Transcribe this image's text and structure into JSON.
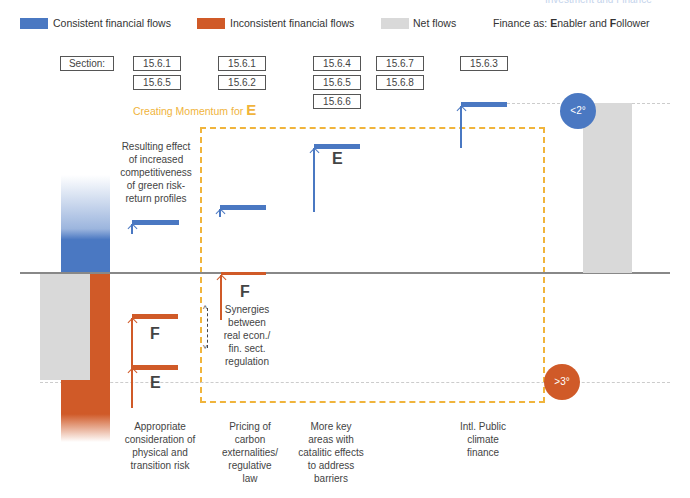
{
  "header": {
    "top_right_text": "Investment and Finance"
  },
  "legend": {
    "items": [
      {
        "label": "Consistent financial flows",
        "color": "#4a78c2"
      },
      {
        "label": "Inconsistent financial flows",
        "color": "#d05a28"
      },
      {
        "label": "Net flows",
        "color": "#d9d9d9"
      }
    ],
    "finance_as_prefix": "Finance as: ",
    "enabler": "Enabler",
    "and": " and ",
    "follower": "Follower"
  },
  "sections": {
    "label": "Section:",
    "columns": [
      [
        "15.6.1",
        "15.6.5"
      ],
      [
        "15.6.1",
        "15.6.2"
      ],
      [
        "15.6.4",
        "15.6.5",
        "15.6.6"
      ],
      [
        "15.6.7",
        "15.6.8"
      ],
      [
        "15.6.3"
      ]
    ]
  },
  "momentum": {
    "text": "Creating Momentum for ",
    "letter": "E"
  },
  "annotations": {
    "resulting_effect": "Resulting effect of increased competitiveness of green risk-return profiles",
    "synergies": "Synergies between real econ./ fin. sect. regulation"
  },
  "letters": {
    "e1": "E",
    "f1": "F",
    "f2": "F",
    "e2": "E"
  },
  "targets": {
    "below2": "<2°",
    "above3": ">3°"
  },
  "categories": [
    "Appropriate consideration of physical and transition risk",
    "Pricing of carbon externalities/ regulative law",
    "More key areas with catalitic effects to address barriers",
    "Intl. Public climate finance"
  ],
  "colors": {
    "blue": "#4a78c2",
    "orange": "#d05a28",
    "gray": "#d9d9d9",
    "dash_orange": "#f0b43c",
    "momentum_text": "#f0b43c"
  }
}
